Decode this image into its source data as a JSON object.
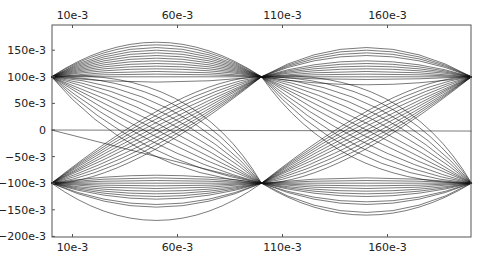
{
  "chart_data": {
    "type": "line",
    "title": "",
    "xlabel": "",
    "ylabel": "",
    "xlim": [
      0.0,
      0.2
    ],
    "ylim": [
      -0.2,
      0.18
    ],
    "grid": false,
    "legend": null,
    "x_ticks_top": [
      "10e-3",
      "60e-3",
      "110e-3",
      "160e-3"
    ],
    "x_ticks_bottom": [
      "10e-3",
      "60e-3",
      "110e-3",
      "160e-3"
    ],
    "x_tick_values": [
      0.01,
      0.06,
      0.11,
      0.16
    ],
    "y_ticks": [
      "150e-3",
      "100e-3",
      "50e-3",
      "0",
      "-50e-3",
      "-100e-3",
      "-150e-3",
      "-200e-3"
    ],
    "y_tick_values": [
      0.15,
      0.1,
      0.05,
      0.0,
      -0.05,
      -0.1,
      -0.15,
      -0.2
    ],
    "line_color": "#111111",
    "nodes": [
      [
        0.0,
        0.1
      ],
      [
        0.0,
        -0.1
      ],
      [
        0.1,
        0.1
      ],
      [
        0.1,
        -0.1
      ],
      [
        0.2,
        0.1
      ],
      [
        0.2,
        -0.1
      ]
    ],
    "segments": [
      {
        "x0": 0.0,
        "y0": 0.1,
        "x1": 0.1,
        "y1": 0.1,
        "peaks": [
          0.165,
          0.16,
          0.155,
          0.15,
          0.145,
          0.14,
          0.135,
          0.13,
          0.125,
          0.12,
          0.115,
          0.11,
          0.105,
          0.1,
          0.09
        ]
      },
      {
        "x0": 0.0,
        "y0": -0.1,
        "x1": 0.1,
        "y1": -0.1,
        "peaks": [
          -0.17,
          -0.145,
          -0.14,
          -0.13,
          -0.125,
          -0.12,
          -0.115,
          -0.11,
          -0.105,
          -0.1,
          -0.095,
          -0.09,
          -0.085
        ]
      },
      {
        "x0": 0.0,
        "y0": 0.1,
        "x1": 0.1,
        "y1": -0.1,
        "bends": [
          0.04,
          0.03,
          0.02,
          0.01,
          0.0,
          -0.01,
          -0.02,
          -0.03,
          -0.04,
          0.05,
          0.06
        ]
      },
      {
        "x0": 0.0,
        "y0": -0.1,
        "x1": 0.1,
        "y1": 0.1,
        "bends": [
          0.04,
          0.03,
          0.02,
          0.01,
          0.0,
          -0.01,
          -0.02,
          -0.03,
          -0.04,
          0.05,
          -0.05
        ]
      },
      {
        "x0": 0.1,
        "y0": 0.1,
        "x1": 0.2,
        "y1": 0.1,
        "peaks": [
          0.155,
          0.15,
          0.145,
          0.14,
          0.13,
          0.125,
          0.12,
          0.115,
          0.11,
          0.105,
          0.1,
          0.095,
          0.085
        ]
      },
      {
        "x0": 0.1,
        "y0": -0.1,
        "x1": 0.2,
        "y1": -0.1,
        "peaks": [
          -0.16,
          -0.155,
          -0.14,
          -0.135,
          -0.125,
          -0.12,
          -0.115,
          -0.11,
          -0.105,
          -0.1,
          -0.095,
          -0.09
        ]
      },
      {
        "x0": 0.1,
        "y0": 0.1,
        "x1": 0.2,
        "y1": -0.1,
        "bends": [
          0.04,
          0.03,
          0.02,
          0.01,
          0.0,
          -0.01,
          -0.02,
          -0.03,
          -0.04,
          0.05,
          0.06,
          -0.05
        ]
      },
      {
        "x0": 0.1,
        "y0": -0.1,
        "x1": 0.2,
        "y1": 0.1,
        "bends": [
          0.04,
          0.03,
          0.02,
          0.01,
          0.0,
          -0.01,
          -0.02,
          -0.03,
          -0.04,
          0.05,
          -0.05
        ]
      }
    ],
    "straight_lines": [
      {
        "x": [
          0.0,
          0.2
        ],
        "y": [
          0.0,
          -0.002
        ]
      },
      {
        "x": [
          0.0,
          0.1
        ],
        "y": [
          0.0,
          -0.1
        ]
      }
    ]
  },
  "plot_area": {
    "left": 52,
    "right": 471,
    "top": 25,
    "bottom": 237
  }
}
